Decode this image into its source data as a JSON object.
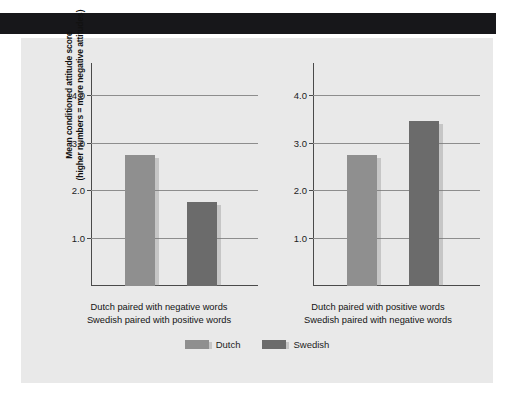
{
  "figure": {
    "background": "#e9e9e9",
    "page_background": "#ffffff",
    "top_band_color": "#17171a"
  },
  "legend": {
    "items": [
      {
        "label": "Dutch",
        "color": "#8f8f8f"
      },
      {
        "label": "Swedish",
        "color": "#6b6b6b"
      }
    ]
  },
  "chart_data": {
    "type": "bar",
    "title": "",
    "subtitle": "",
    "xlabel": "",
    "ylabel": "Mean conditioned attitude score (higher numbers = more negative attitudes)",
    "ylabel_line1": "Mean conditioned attitude score",
    "ylabel_line2": "(higher numbers = more negative attitudes)",
    "ylim": [
      0.0,
      4.5
    ],
    "yticks": [
      "1.0",
      "2.0",
      "3.0",
      "4.0"
    ],
    "ytick_values": [
      1.0,
      2.0,
      3.0,
      4.0
    ],
    "grid": true,
    "legend_position": "bottom-center",
    "series": [
      {
        "name": "Dutch",
        "color": "#8f8f8f",
        "values": [
          2.75,
          2.75
        ]
      },
      {
        "name": "Swedish",
        "color": "#6b6b6b",
        "values": [
          1.75,
          3.45
        ]
      }
    ],
    "categories": [
      "Dutch paired with negative words / Swedish paired with positive words",
      "Dutch paired with positive words / Swedish paired with negative words"
    ],
    "panels": [
      {
        "xlabel_line1": "Dutch paired with negative words",
        "xlabel_line2": "Swedish paired with positive words",
        "bars": [
          {
            "series": "Dutch",
            "value": 2.75,
            "color": "#8f8f8f"
          },
          {
            "series": "Swedish",
            "value": 1.75,
            "color": "#6b6b6b"
          }
        ]
      },
      {
        "xlabel_line1": "Dutch paired with positive words",
        "xlabel_line2": "Swedish paired with negative words",
        "bars": [
          {
            "series": "Dutch",
            "value": 2.75,
            "color": "#8f8f8f"
          },
          {
            "series": "Swedish",
            "value": 3.45,
            "color": "#6b6b6b"
          }
        ]
      }
    ]
  }
}
